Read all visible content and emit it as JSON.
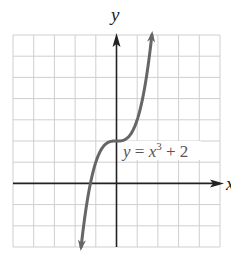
{
  "chart_data": {
    "type": "line",
    "title": "",
    "xlabel": "x",
    "ylabel": "y",
    "xlim": [
      -5,
      5
    ],
    "ylim": [
      -3,
      7
    ],
    "grid": true,
    "grid_step": 1,
    "series": [
      {
        "name": "y = x^3 + 2",
        "function": "x^3 + 2",
        "x": [
          -1.71,
          -1.5,
          -1.26,
          -1.0,
          -0.5,
          0,
          0.5,
          1.0,
          1.5,
          1.71
        ],
        "values": [
          -3.0,
          -1.38,
          0.0,
          1.0,
          1.88,
          2.0,
          2.13,
          3.0,
          5.38,
          7.0
        ],
        "color": "#666666"
      }
    ],
    "annotations": [
      {
        "text_parts": [
          "y",
          " = ",
          "x",
          "3",
          " + 2"
        ],
        "x": 0.3,
        "y": 1.3
      }
    ]
  },
  "labels": {
    "x_axis": "x",
    "y_axis": "y",
    "equation_y": "y",
    "equation_eq": " = ",
    "equation_x": "x",
    "equation_exp": "3",
    "equation_rest": " + 2"
  },
  "colors": {
    "curve": "#666666",
    "axes": "#222222",
    "grid": "#cfcfcf"
  }
}
